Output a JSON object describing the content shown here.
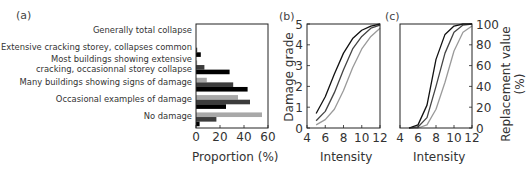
{
  "chart_data": [
    {
      "panel": "(a)",
      "type": "bar",
      "orientation": "horizontal",
      "categories": [
        "Generally total collapse",
        "Extensive cracking storey, collapses common",
        "Most buildings showing extensive cracking, occasionnal storey collapse",
        "Many buildings showing signs of damage",
        "Occasional examples of damage",
        "No damage"
      ],
      "category_lines": [
        [
          "Generally total collapse"
        ],
        [
          "Extensive cracking storey, collapses common"
        ],
        [
          "Most buildings showing extensive",
          "cracking, occasionnal storey collapse"
        ],
        [
          "Many buildings showing signs of damage"
        ],
        [
          "Occasional examples of damage"
        ],
        [
          "No damage"
        ]
      ],
      "series": [
        {
          "name": "light",
          "color": "#a8a8a8",
          "values": [
            0,
            0,
            1,
            9,
            35,
            55
          ]
        },
        {
          "name": "medium",
          "color": "#3c3c3c",
          "values": [
            0,
            1,
            7,
            31,
            45,
            17
          ]
        },
        {
          "name": "dark",
          "color": "#000000",
          "values": [
            0,
            4,
            28,
            43,
            25,
            3
          ]
        }
      ],
      "xlabel": "Proportion (%)",
      "ylabel": "",
      "xlim": [
        0,
        60
      ],
      "xticks": [
        "0",
        "20",
        "40",
        "60"
      ],
      "grid": false
    },
    {
      "panel": "(b)",
      "type": "line",
      "x": [
        5,
        6,
        7,
        8,
        9,
        10,
        11,
        12
      ],
      "series": [
        {
          "name": "dark",
          "color": "#111111",
          "values": [
            0.7,
            1.5,
            2.6,
            3.6,
            4.3,
            4.7,
            4.9,
            5.0
          ]
        },
        {
          "name": "medium",
          "color": "#444444",
          "values": [
            0.35,
            0.8,
            1.7,
            2.8,
            3.8,
            4.4,
            4.8,
            4.95
          ]
        },
        {
          "name": "light",
          "color": "#9a9a9a",
          "values": [
            0.15,
            0.4,
            0.9,
            1.8,
            2.9,
            3.8,
            4.4,
            4.8
          ]
        }
      ],
      "xlabel": "Intensity",
      "ylabel": "Damage grade",
      "xlim": [
        4,
        12
      ],
      "ylim": [
        0,
        5
      ],
      "xticks": [
        "4",
        "6",
        "8",
        "10",
        "12"
      ],
      "yticks": [
        "0",
        "1",
        "2",
        "3",
        "4",
        "5"
      ],
      "grid": false
    },
    {
      "panel": "(c)",
      "type": "line",
      "x": [
        5,
        6,
        7,
        8,
        9,
        10,
        11,
        12
      ],
      "series": [
        {
          "name": "dark",
          "color": "#111111",
          "values": [
            0,
            3,
            22,
            66,
            90,
            98,
            100,
            100
          ]
        },
        {
          "name": "medium",
          "color": "#444444",
          "values": [
            0,
            1,
            10,
            40,
            72,
            92,
            99,
            100
          ]
        },
        {
          "name": "light",
          "color": "#9a9a9a",
          "values": [
            0,
            0,
            3,
            18,
            44,
            74,
            92,
            98
          ]
        }
      ],
      "xlabel": "Intensity",
      "ylabel": "Replacement value (%)",
      "xlim": [
        4,
        12
      ],
      "ylim": [
        0,
        100
      ],
      "xticks": [
        "4",
        "6",
        "8",
        "10",
        "12"
      ],
      "yticks": [
        "0",
        "20",
        "40",
        "60",
        "80",
        "100"
      ],
      "y_axis_side": "right",
      "grid": false
    }
  ]
}
